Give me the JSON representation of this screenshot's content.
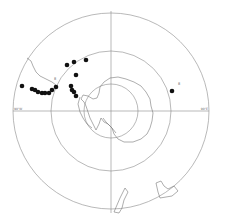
{
  "map": {
    "projection": "south-polar-stereographic",
    "colors": {
      "background": "#ffffff",
      "grid": "#8a8a8a",
      "coast": "#777777",
      "point": "#111111"
    },
    "grid": {
      "center": [
        111,
        111
      ],
      "circles": [
        {
          "name": "outer-latitude-circle",
          "r": 98
        },
        {
          "name": "middle-latitude-circle",
          "r": 60
        },
        {
          "name": "inner-latitude-circle",
          "r": 27
        }
      ],
      "meridian_labels": {
        "left": "90°W",
        "right": "90°E",
        "top": "0°",
        "bottom": "180°"
      }
    },
    "points": [
      {
        "x": 22,
        "y": 86
      },
      {
        "x": 32,
        "y": 89
      },
      {
        "x": 35,
        "y": 90
      },
      {
        "x": 38,
        "y": 92
      },
      {
        "x": 42,
        "y": 93
      },
      {
        "x": 45,
        "y": 93
      },
      {
        "x": 49,
        "y": 93
      },
      {
        "x": 52,
        "y": 90
      },
      {
        "x": 56,
        "y": 87
      },
      {
        "x": 67,
        "y": 65
      },
      {
        "x": 74,
        "y": 62
      },
      {
        "x": 86,
        "y": 60
      },
      {
        "x": 76,
        "y": 75
      },
      {
        "x": 71,
        "y": 86
      },
      {
        "x": 72,
        "y": 90
      },
      {
        "x": 74,
        "y": 92
      },
      {
        "x": 76,
        "y": 96
      },
      {
        "x": 172,
        "y": 91
      }
    ],
    "markers": [
      {
        "text": "8",
        "x": 54,
        "y": 80
      },
      {
        "text": "8",
        "x": 178,
        "y": 85
      }
    ]
  }
}
